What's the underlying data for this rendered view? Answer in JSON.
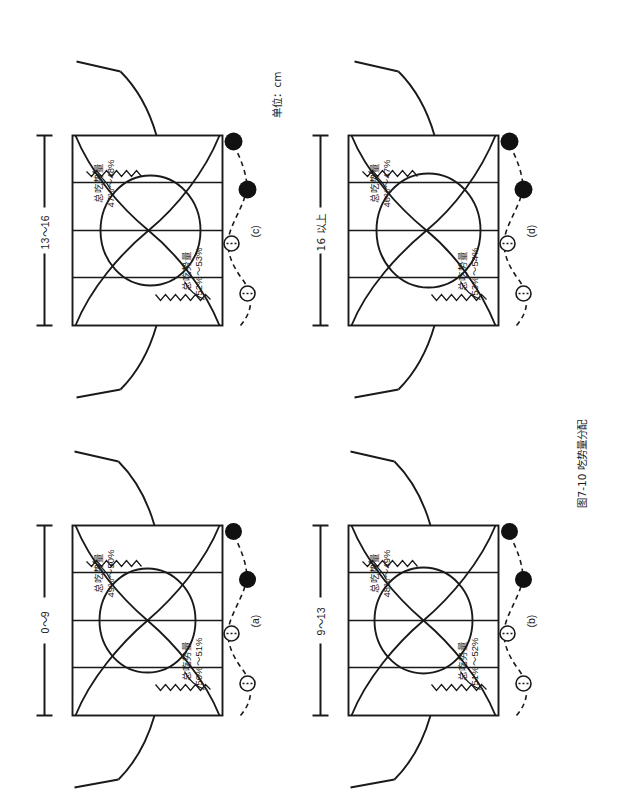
{
  "figure": {
    "caption": "图7-10 吃势量分配",
    "unit_note": "单位：cm",
    "ease_term": "总吃势量"
  },
  "panels": [
    {
      "id": "a",
      "letter": "(a)",
      "dimension": "0～9",
      "top_ease_term": "总吃势量",
      "top_ease_value": "49%～50%",
      "bottom_ease_term": "总吃势量",
      "bottom_ease_value": "50%～51%"
    },
    {
      "id": "b",
      "letter": "(b)",
      "dimension": "9～13",
      "top_ease_term": "总吃势量",
      "top_ease_value": "48%～49%",
      "bottom_ease_term": "总吃势量",
      "bottom_ease_value": "51%～52%"
    },
    {
      "id": "c",
      "letter": "(c)",
      "dimension": "13～16",
      "top_ease_term": "总吃势量",
      "top_ease_value": "47%～48%",
      "bottom_ease_term": "总吃势量",
      "bottom_ease_value": "52%～53%"
    },
    {
      "id": "d",
      "letter": "(d)",
      "dimension": "16 以上",
      "top_ease_term": "总吃势量",
      "top_ease_value": "46%～47%",
      "bottom_ease_term": "总吃势量",
      "bottom_ease_value": "53%～54%"
    }
  ],
  "colors": {
    "ink": "#1a1a1a",
    "paper": "#ffffff",
    "marker_filled": "#111111",
    "marker_open": "#ffffff"
  },
  "markers": {
    "open_circle": "open-circle-marker",
    "filled_circle": "filled-circle-marker"
  }
}
